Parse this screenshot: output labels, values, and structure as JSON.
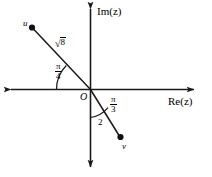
{
  "figure": {
    "type": "complex-plane-vector-diagram",
    "background_color": "#ffffff",
    "stroke_color": "#1a1a1a",
    "axes": {
      "real": {
        "label": "Re(z)",
        "orientation": "horizontal",
        "double_headed": true
      },
      "imaginary": {
        "label": "Im(z)",
        "orientation": "vertical",
        "double_headed": true
      },
      "origin_label": "O"
    },
    "vectors": [
      {
        "name": "u",
        "point_label": "u",
        "magnitude_label": "√8",
        "magnitude_radicand": "8",
        "angle_label_numerator": "π",
        "angle_label_denominator": "4",
        "angle_from": "negative real axis",
        "quadrant": "second"
      },
      {
        "name": "v",
        "point_label": "v",
        "magnitude_label": "2",
        "angle_label_numerator": "π",
        "angle_label_denominator": "3",
        "angle_from": "negative imaginary axis",
        "quadrant": "fourth"
      }
    ]
  }
}
